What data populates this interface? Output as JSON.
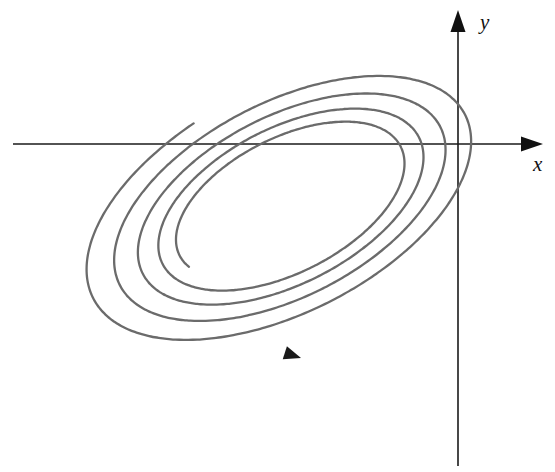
{
  "figure": {
    "background_color": "#ffffff",
    "width": 555,
    "height": 472
  },
  "axes": {
    "color": "#1a1a1a",
    "origin": {
      "x": 458,
      "y": 144
    },
    "x_axis": {
      "label": "x",
      "label_position": {
        "x": 533,
        "y": 166
      },
      "start": {
        "x": 13,
        "y": 144
      },
      "end": {
        "x": 543,
        "y": 144
      },
      "arrow": "right"
    },
    "y_axis": {
      "label": "y",
      "label_position": {
        "x": 480,
        "y": 24
      },
      "start": {
        "x": 458,
        "y": 466
      },
      "end": {
        "x": 458,
        "y": 10
      },
      "arrow": "up"
    }
  },
  "chart_data": {
    "type": "line",
    "xlabel": "x",
    "ylabel": "y",
    "grid": false,
    "legend": "none",
    "curve_color": "#6b6b6b",
    "curve_width": 2.3,
    "spiral": {
      "center": {
        "x": 286,
        "y": 203
      },
      "tilt_degrees": -27,
      "turns": 4.25,
      "points_per_turn": 240,
      "radius_start_major": 118,
      "radius_end_major": 222,
      "axis_ratio": 0.52,
      "growth": "geometric",
      "start_angle_degrees": 168,
      "sweep_direction": "clockwise-on-screen"
    },
    "extents": {
      "leftmost_x": 73,
      "rightmost_x": 497,
      "topmost_y": 42,
      "bottommost_y": 366
    },
    "direction_arrow": {
      "tip": {
        "x": 301,
        "y": 358
      },
      "heading_degrees": 18,
      "size": 17,
      "color": "#1a1a1a",
      "meaning": "direction of increasing time along the trajectory"
    }
  }
}
